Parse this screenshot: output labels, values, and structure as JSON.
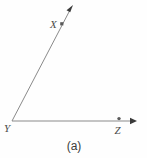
{
  "figure": {
    "type": "geometry-angle-diagram",
    "caption": "(a)",
    "background_color": "#fdfdfd",
    "line_color": "#8a8a8a",
    "label_color": "#4a4a4a",
    "arrow_color": "#3a3a3a",
    "vertex": {
      "name": "Y",
      "label": "Y",
      "x": 12,
      "y": 121
    },
    "rays": [
      {
        "name": "ray-YX",
        "through_point_label": "X",
        "through_point": {
          "x": 62,
          "y": 24
        },
        "start": {
          "x": 12,
          "y": 121
        },
        "end": {
          "x": 72,
          "y": 7
        },
        "label_position": {
          "x": 50,
          "y": 27
        },
        "has_arrowhead": true
      },
      {
        "name": "ray-YZ",
        "through_point_label": "Z",
        "through_point": {
          "x": 119,
          "y": 119
        },
        "start": {
          "x": 12,
          "y": 121
        },
        "end": {
          "x": 137,
          "y": 121
        },
        "label_position": {
          "x": 115,
          "y": 133
        },
        "has_arrowhead": true
      }
    ],
    "points": [
      {
        "label": "X",
        "x": 62,
        "y": 24
      },
      {
        "label": "Y",
        "x": 12,
        "y": 121
      },
      {
        "label": "Z",
        "x": 119,
        "y": 119
      }
    ]
  }
}
